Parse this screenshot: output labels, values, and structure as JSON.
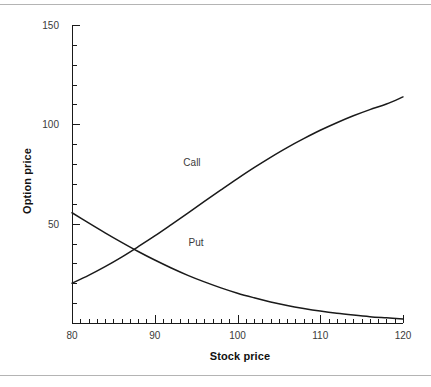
{
  "chart_data": {
    "type": "line",
    "title": "",
    "xlabel": "Stock price",
    "ylabel": "Option price",
    "xlim": [
      80,
      120
    ],
    "ylim": [
      0,
      150
    ],
    "xticks": [
      80,
      90,
      100,
      110,
      120
    ],
    "yticks": [
      50,
      100,
      150
    ],
    "xtick_labels": [
      "80",
      "90",
      "100",
      "110",
      "120"
    ],
    "ytick_labels": [
      "50",
      "100",
      "150"
    ],
    "xminor_step": 1,
    "yminor_step": 10,
    "grid": false,
    "legend_position": "inline-annotations",
    "annotations": [
      {
        "text": "Call",
        "x": 94.5,
        "y": 81
      },
      {
        "text": "Put",
        "x": 95.0,
        "y": 41
      }
    ],
    "series": [
      {
        "name": "Call",
        "color": "#1a1a1a",
        "x": [
          80,
          82,
          84,
          86,
          88,
          90,
          92,
          94,
          96,
          98,
          100,
          102,
          104,
          106,
          108,
          110,
          112,
          114,
          116,
          118,
          120
        ],
        "values": [
          20.0,
          24.0,
          28.4,
          33.2,
          38.4,
          43.8,
          49.5,
          55.3,
          61.2,
          67.0,
          72.7,
          78.2,
          83.4,
          88.3,
          92.8,
          97.0,
          100.8,
          104.3,
          107.4,
          110.2,
          113.8
        ]
      },
      {
        "name": "Put",
        "color": "#1a1a1a",
        "x": [
          80,
          82,
          84,
          86,
          88,
          90,
          92,
          94,
          96,
          98,
          100,
          102,
          104,
          106,
          108,
          110,
          112,
          114,
          116,
          118,
          120
        ],
        "values": [
          55.5,
          50.4,
          45.4,
          40.6,
          36.0,
          31.7,
          27.7,
          24.0,
          20.7,
          17.7,
          15.0,
          12.7,
          10.6,
          8.8,
          7.3,
          6.0,
          4.9,
          4.0,
          3.2,
          2.6,
          2.0
        ]
      }
    ]
  },
  "figure": {
    "axis_color": "#1a1a1a",
    "rule_color": "#b4b4b4",
    "background": "#ffffff"
  }
}
